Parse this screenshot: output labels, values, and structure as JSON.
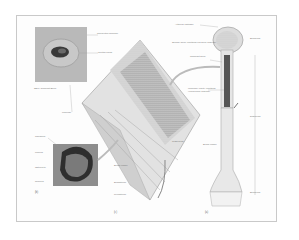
{
  "figure": {
    "panels": {
      "a": {
        "tag": "(a)"
      },
      "b": {
        "tag": "(b)"
      },
      "c": {
        "tag": "(c)"
      }
    },
    "labels_micrograph_top": {
      "lamellae": "Concentric lamellae",
      "canal": "Central canal",
      "caption": "SEM: Compact Bone",
      "perforating": "Lacunae"
    },
    "labels_micrograph_bottom": {
      "canaliculi": "Canaliculi",
      "lacuna": "Lacuna",
      "osteocyte": "Osteocyte",
      "nucleus": "Nucleus"
    },
    "labels_section": {
      "trabeculae": "Trabeculae",
      "blood_vessel": "Blood vessel",
      "endosteum": "Endosteum",
      "periosteum": "Periosteum"
    },
    "labels_long_bone": {
      "articular_cartilage": "Articular cartilage",
      "spongy_bone": "Spongy bone (contains red bone marrow)",
      "compact_bone": "Compact bone",
      "medullary_cavity": "Medullary cavity (contains yellow bone marrow)",
      "blood_vessel": "Blood vessel",
      "epiphysis_top": "Epiphysis",
      "diaphysis": "Diaphysis",
      "epiphysis_bottom": "Epiphysis"
    },
    "colors": {
      "frame": "#c9c9c9",
      "ink": "#555555",
      "dark": "#333333"
    }
  }
}
